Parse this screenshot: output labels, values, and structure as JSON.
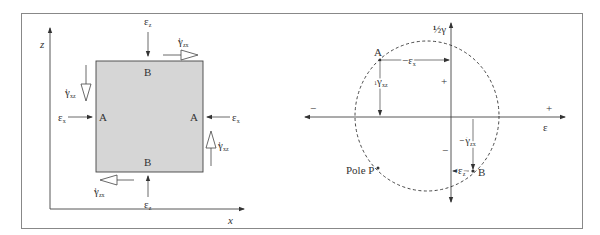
{
  "figure": {
    "left_panel": {
      "title": "Strained element",
      "axes": {
        "vertical": "z",
        "horizontal": "x"
      },
      "element_fill": "#d6d6d6",
      "faces": {
        "vertical_faces": "A",
        "horizontal_faces": "B"
      },
      "labels": {
        "eps_z": "ε",
        "eps_z_sub": "z",
        "eps_x": "ε",
        "eps_x_sub": "x",
        "half": "½",
        "gamma": "γ",
        "gamma_zx_sub": "zx",
        "gamma_xz_sub": "xz",
        "face_A": "A",
        "face_B": "B"
      }
    },
    "right_panel": {
      "title": "Mohr's circle of strain",
      "axes": {
        "vertical": "½γ",
        "horizontal": "ε"
      },
      "signs": {
        "positive": "+",
        "negative": "−"
      },
      "points": {
        "A": "A",
        "B": "B",
        "pole": "Pole P"
      },
      "labels": {
        "minus_eps_x": "−ε",
        "minus_eps_x_sub": "x",
        "half_gamma_xz": "½γ",
        "half_gamma_xz_sub": "xz",
        "minus_half_gamma_zx": "−½γ",
        "minus_half_gamma_zx_sub": "zx",
        "eps_z": "ε",
        "eps_z_sub": "z"
      }
    }
  }
}
